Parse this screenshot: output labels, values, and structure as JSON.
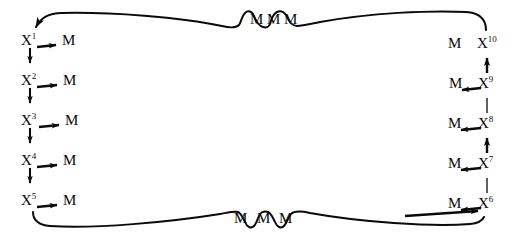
{
  "diagram": {
    "type": "cyclic-chain-diagram",
    "stroke_color": "#0a0a0a",
    "background_color": "#ffffff",
    "left_column": {
      "nodes": [
        {
          "base": "X",
          "sup": "1",
          "m_label": "M"
        },
        {
          "base": "X",
          "sup": "2",
          "m_label": "M"
        },
        {
          "base": "X",
          "sup": "3",
          "m_label": "M"
        },
        {
          "base": "X",
          "sup": "4",
          "m_label": "M"
        },
        {
          "base": "X",
          "sup": "5",
          "m_label": "M"
        }
      ]
    },
    "right_column": {
      "nodes": [
        {
          "base": "X",
          "sup": "10",
          "m_label": "M"
        },
        {
          "base": "X",
          "sup": "9",
          "m_label": "M"
        },
        {
          "base": "X",
          "sup": "8",
          "m_label": "M"
        },
        {
          "base": "X",
          "sup": "7",
          "m_label": "M"
        },
        {
          "base": "X",
          "sup": "6",
          "m_label": "M"
        }
      ]
    },
    "top_wave": {
      "m_labels": [
        "M",
        "M",
        "M"
      ]
    },
    "bottom_wave": {
      "m_labels": [
        "M",
        "M",
        "M"
      ]
    }
  }
}
